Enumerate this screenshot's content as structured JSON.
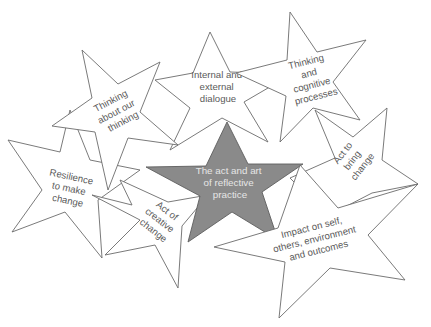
{
  "diagram": {
    "type": "star-cluster",
    "center": {
      "lines": [
        "The act and art",
        "of reflective",
        "practice"
      ],
      "fill": "#8a8a8a"
    },
    "stars": [
      {
        "id": "internal-external-dialogue",
        "lines": [
          "Internal and",
          "external",
          "dialogue"
        ]
      },
      {
        "id": "thinking-cognitive-processes",
        "lines": [
          "Thinking",
          "and",
          "cognitive",
          "processes"
        ]
      },
      {
        "id": "thinking-about-thinking",
        "lines": [
          "Thinking",
          "about our",
          "thinking"
        ]
      },
      {
        "id": "resilience-to-make-change",
        "lines": [
          "Resilience",
          "to make",
          "change"
        ]
      },
      {
        "id": "act-to-bring-change",
        "lines": [
          "Act to",
          "bring",
          "change"
        ]
      },
      {
        "id": "act-of-creative-change",
        "lines": [
          "Act of",
          "creative",
          "change"
        ]
      },
      {
        "id": "impact",
        "lines": [
          "Impact on self,",
          "others, environment",
          "and outcomes"
        ]
      }
    ],
    "colors": {
      "outline": "#6b6b6b",
      "star_fill": "#ffffff",
      "center_fill": "#8a8a8a",
      "label_text": "#5a5a5a",
      "center_text": "#e6e6e6"
    }
  }
}
